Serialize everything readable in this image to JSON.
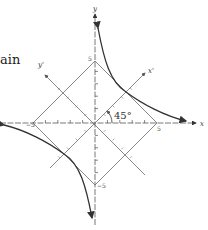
{
  "page": {
    "fragment_text": "ain"
  },
  "diagram": {
    "origin_px": [
      95,
      123
    ],
    "unit_px": 12.4,
    "axes": {
      "x_label": "x",
      "y_label": "y",
      "x_prime_label": "x'",
      "y_prime_label": "y'",
      "rotation_angle_label": "45°"
    },
    "tick_labels": {
      "x_pos": "5",
      "x_neg": "−5",
      "y_pos": "5",
      "y_neg": "−5"
    },
    "square_vertices": [
      [
        5,
        0
      ],
      [
        0,
        5
      ],
      [
        -5,
        0
      ],
      [
        0,
        -5
      ]
    ],
    "hyperbola": {
      "equation": "xy = 25/4",
      "tangent_points": [
        [
          2.5,
          2.5
        ],
        [
          -2.5,
          -2.5
        ]
      ]
    },
    "colors": {
      "line": "#6b6b6b",
      "curve": "#333333",
      "text": "#333333"
    }
  }
}
